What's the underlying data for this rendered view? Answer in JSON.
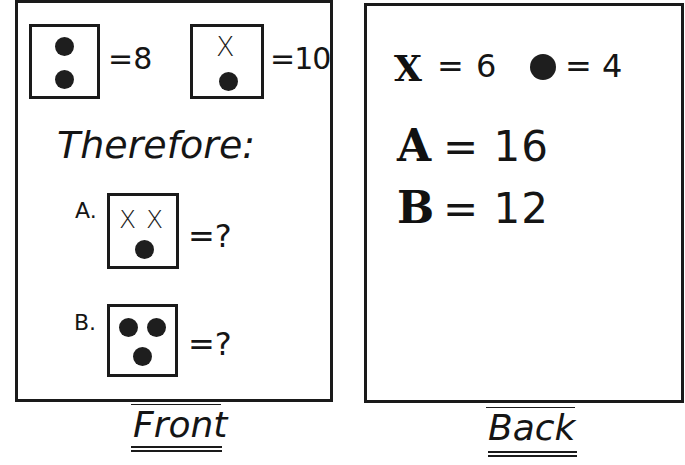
{
  "front": {
    "title": "Front",
    "givens": [
      {
        "symbols": [
          "dot",
          "dot"
        ],
        "equation": "=8",
        "value": 8
      },
      {
        "symbols": [
          "x",
          "dot"
        ],
        "equation": "=10",
        "value": 10
      }
    ],
    "therefore_label": "Therefore:",
    "questions": [
      {
        "label": "A.",
        "symbols": [
          "x",
          "x",
          "dot"
        ],
        "equation": "=?"
      },
      {
        "label": "B.",
        "symbols": [
          "dot",
          "dot",
          "dot"
        ],
        "equation": "=?"
      }
    ],
    "x_glyph": "X"
  },
  "back": {
    "title": "Back",
    "symbol_values": [
      {
        "symbol": "X",
        "equation": "= 6",
        "value": 6
      },
      {
        "symbol": "dot",
        "equation": "= 4",
        "value": 4
      }
    ],
    "answers": [
      {
        "label": "A",
        "equation": "= 16",
        "value": 16
      },
      {
        "label": "B",
        "equation": "= 12",
        "value": 12
      }
    ]
  }
}
